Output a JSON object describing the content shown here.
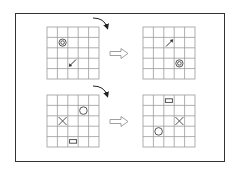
{
  "diagram": {
    "title": "",
    "colors": {
      "grid_line": "#9a9a9a",
      "stroke": "#444444",
      "frame": "#333333",
      "background": "#ffffff"
    },
    "grid": {
      "rows": 5,
      "cols": 5
    },
    "transformation": {
      "type": "rotate-180",
      "rotation_arrow_icon": "curved-arrow-clockwise-icon",
      "transition_arrow_icon": "hollow-right-arrow-icon"
    },
    "examples": [
      {
        "input": {
          "items": [
            {
              "shape": "target-circle",
              "row": 1,
              "col": 1
            },
            {
              "shape": "arrow-down-left",
              "row": 3,
              "col": 2
            }
          ]
        },
        "output": {
          "items": [
            {
              "shape": "arrow-up-right",
              "row": 1,
              "col": 2
            },
            {
              "shape": "target-circle",
              "row": 3,
              "col": 3
            }
          ]
        }
      },
      {
        "input": {
          "items": [
            {
              "shape": "circle",
              "row": 1,
              "col": 3
            },
            {
              "shape": "x-cross",
              "row": 2,
              "col": 1
            },
            {
              "shape": "rectangle",
              "row": 4,
              "col": 2
            }
          ]
        },
        "output": {
          "items": [
            {
              "shape": "rectangle",
              "row": 0,
              "col": 2
            },
            {
              "shape": "x-cross",
              "row": 2,
              "col": 3
            },
            {
              "shape": "circle",
              "row": 3,
              "col": 1
            }
          ]
        }
      }
    ]
  }
}
